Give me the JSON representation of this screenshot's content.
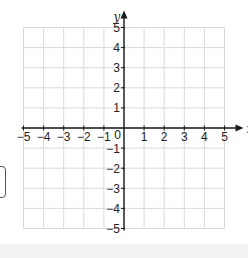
{
  "chart_data": {
    "type": "scatter",
    "title": "",
    "xlabel": "x",
    "ylabel": "y",
    "xlim": [
      -5,
      5
    ],
    "ylim": [
      -5,
      5
    ],
    "grid": true,
    "x_ticks": [
      -5,
      -4,
      -3,
      -2,
      -1,
      1,
      2,
      3,
      4,
      5
    ],
    "y_ticks": [
      -5,
      -4,
      -3,
      -2,
      -1,
      1,
      2,
      3,
      4,
      5
    ],
    "x_tick_labels": [
      "−5",
      "−4",
      "−3",
      "−2",
      "−1",
      "1",
      "2",
      "3",
      "4",
      "5"
    ],
    "y_tick_labels": [
      "−5",
      "−4",
      "−3",
      "−2",
      "−1",
      "1",
      "2",
      "3",
      "4",
      "5"
    ],
    "origin_label": "0",
    "series": [],
    "legend": null
  },
  "colors": {
    "grid": "#d9d9d9",
    "axis": "#1a1a1a",
    "bottom_strip": "#f2f2f2"
  }
}
